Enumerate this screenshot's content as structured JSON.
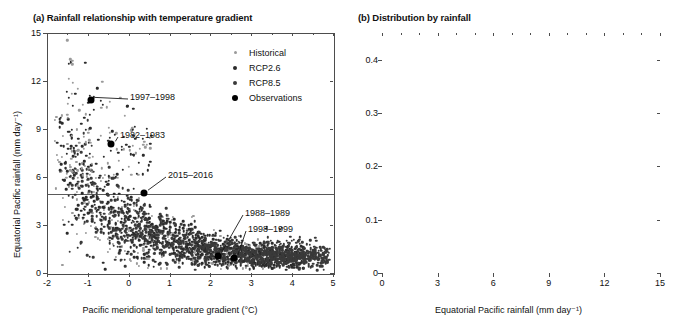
{
  "figure": {
    "width": 677,
    "height": 332,
    "background": "#ffffff"
  },
  "panel_a": {
    "title": "(a) Rainfall relationship with temperature gradient",
    "xlabel": "Pacific meridional temperature gradient (°C)",
    "ylabel": "Equatorial Pacific rainfall (mm day⁻¹)",
    "xticks": [
      "-2",
      "-1",
      "0",
      "1",
      "2",
      "3",
      "4",
      "5"
    ],
    "yticks": [
      "0",
      "3",
      "6",
      "9",
      "12",
      "15"
    ],
    "legend": [
      {
        "label": "Historical",
        "color": "#9a9a9a",
        "size": 3
      },
      {
        "label": "RCP2.6",
        "color": "#2b2b2b",
        "size": 4
      },
      {
        "label": "RCP8.5",
        "color": "#3a3a3a",
        "size": 4
      },
      {
        "label": "Observations",
        "color": "#000000",
        "size": 6
      }
    ],
    "annotations": [
      {
        "label": "1997–1998",
        "x": -0.65,
        "y": 10.85
      },
      {
        "label": "1982–1983",
        "x": -0.35,
        "y": 8.1
      },
      {
        "label": "2015–2016",
        "x": 0.38,
        "y": 5.1
      },
      {
        "label": "1988–1989",
        "x": 2.15,
        "y": 1.15
      },
      {
        "label": "1998–1999",
        "x": 2.6,
        "y": 1.05
      }
    ],
    "reference_line_y": 5
  },
  "panel_b": {
    "title": "(b) Distribution by rainfall",
    "xlabel": "Equatorial Pacific rainfall (mm day⁻¹)",
    "ylabel": "Proportion of events",
    "xticks": [
      "0",
      "3",
      "6",
      "9",
      "12",
      "15"
    ],
    "yticks": [
      "0",
      "0.1",
      "0.2",
      "0.3",
      "0.4"
    ],
    "legend": [
      {
        "label": "Historical",
        "color": "#a6a6a6"
      },
      {
        "label": "RCP2.6",
        "color": "#1c1c1c"
      },
      {
        "label": "RCP8.5",
        "color": "#333333"
      }
    ],
    "reference_line_x": 5
  },
  "chart_data": [
    {
      "type": "scatter",
      "panel": "a",
      "title": "(a) Rainfall relationship with temperature gradient",
      "xlabel": "Pacific meridional temperature gradient (°C)",
      "ylabel": "Equatorial Pacific rainfall (mm day⁻¹)",
      "xlim": [
        -2,
        5
      ],
      "ylim": [
        0,
        15
      ],
      "grid": false,
      "legend_position": "top-right",
      "reference_lines": [
        {
          "orientation": "horizontal",
          "value": 5
        }
      ],
      "series": [
        {
          "name": "Historical",
          "color": "#9a9a9a",
          "marker_size": 2,
          "n_points": 420,
          "note": "grey cloud, broadly overlapping the model scenarios"
        },
        {
          "name": "RCP2.6",
          "color": "#2b2b2b",
          "marker_size": 2.5,
          "n_points": 900
        },
        {
          "name": "RCP8.5",
          "color": "#3a3a3a",
          "marker_size": 2.5,
          "n_points": 900
        },
        {
          "name": "Observations",
          "color": "#000000",
          "marker_size": 6,
          "points": [
            {
              "x": -0.95,
              "y": 10.85,
              "label": "1997–1998"
            },
            {
              "x": -0.45,
              "y": 8.1,
              "label": "1982–1983"
            },
            {
              "x": 0.35,
              "y": 5.05,
              "label": "2015–2016"
            },
            {
              "x": 2.15,
              "y": 1.15,
              "label": "1988–1989"
            },
            {
              "x": 2.55,
              "y": 1.0,
              "label": "1998–1999"
            }
          ]
        }
      ],
      "relationship": "Rainfall decreases sharply as meridional temperature gradient increases; scatter narrows toward ~1 mm/day at gradients above 3 °C"
    },
    {
      "type": "bar",
      "panel": "b",
      "title": "(b) Distribution by rainfall",
      "xlabel": "Equatorial Pacific rainfall (mm day⁻¹)",
      "ylabel": "Proportion of events",
      "xlim": [
        0,
        15
      ],
      "ylim": [
        0,
        0.45
      ],
      "grid": false,
      "legend_position": "top-right",
      "reference_lines": [
        {
          "orientation": "vertical",
          "value": 5
        }
      ],
      "bin_width": 1,
      "bin_starts": [
        0,
        1,
        2,
        3,
        4,
        5,
        6,
        7,
        8,
        9,
        10,
        11,
        12,
        13,
        14
      ],
      "categories": [
        "0-1",
        "1-2",
        "2-3",
        "3-4",
        "4-5",
        "5-6",
        "6-7",
        "7-8",
        "8-9",
        "9-10",
        "10-11",
        "11-12",
        "12-13",
        "13-14",
        "14-15"
      ],
      "series": [
        {
          "name": "Historical",
          "color": "#a6a6a6",
          "values": [
            0.124,
            0.44,
            0.199,
            0.106,
            0.063,
            0.026,
            0.013,
            0.014,
            0.008,
            0.006,
            0.009,
            0.005,
            0.002,
            0.0,
            0.0
          ]
        },
        {
          "name": "RCP2.6",
          "color": "#1c1c1c",
          "values": [
            0.081,
            0.36,
            0.234,
            0.124,
            0.086,
            0.059,
            0.014,
            0.013,
            0.01,
            0.007,
            0.009,
            0.005,
            0.003,
            0.0,
            0.0
          ]
        },
        {
          "name": "RCP8.5",
          "color": "#333333",
          "values": [
            0.063,
            0.324,
            0.261,
            0.137,
            0.083,
            0.05,
            0.025,
            0.022,
            0.02,
            0.021,
            0.008,
            0.006,
            0.002,
            0.007,
            0.0
          ]
        }
      ]
    }
  ]
}
